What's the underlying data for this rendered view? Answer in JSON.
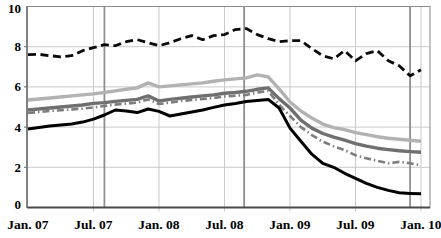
{
  "chart_data": {
    "type": "line",
    "title": "",
    "xlabel": "",
    "ylabel": "",
    "x_axis": {
      "tick_labels": [
        "Jan. 07",
        "Jul. 07",
        "Jan. 08",
        "Jul. 08",
        "Jan. 09",
        "Jul. 09",
        "Jan. 10"
      ],
      "tick_month_index": [
        0,
        6,
        12,
        18,
        24,
        30,
        36
      ],
      "months_total": 36
    },
    "y_axis": {
      "min": 0,
      "max": 10,
      "tick_labels": [
        "0",
        "2",
        "4",
        "6",
        "8",
        "10"
      ],
      "tick_values": [
        0,
        2,
        4,
        6,
        8,
        10
      ]
    },
    "grid": {
      "horizontal": true,
      "vertical": true
    },
    "event_lines_month": [
      7,
      19.8,
      35
    ],
    "series": [
      {
        "name": "light-gray-line",
        "style": "solid",
        "color": "#b2b2b2",
        "width": 3.4,
        "dash": "",
        "values": [
          5.35,
          5.4,
          5.45,
          5.5,
          5.55,
          5.6,
          5.65,
          5.72,
          5.8,
          5.88,
          5.95,
          6.2,
          6.0,
          6.05,
          6.1,
          6.15,
          6.2,
          6.28,
          6.35,
          6.4,
          6.45,
          6.6,
          6.5,
          5.9,
          5.25,
          4.8,
          4.45,
          4.15,
          3.97,
          3.87,
          3.72,
          3.62,
          3.52,
          3.45,
          3.4,
          3.35,
          3.3
        ]
      },
      {
        "name": "medium-gray-line",
        "style": "solid",
        "color": "#6f6f6f",
        "width": 3.4,
        "dash": "",
        "values": [
          4.85,
          4.9,
          4.95,
          5.0,
          5.05,
          5.1,
          5.18,
          5.22,
          5.28,
          5.33,
          5.38,
          5.55,
          5.3,
          5.38,
          5.44,
          5.5,
          5.55,
          5.6,
          5.68,
          5.72,
          5.78,
          5.88,
          5.95,
          5.42,
          4.95,
          4.35,
          3.95,
          3.68,
          3.5,
          3.35,
          3.18,
          3.05,
          2.95,
          2.88,
          2.82,
          2.78,
          2.75
        ]
      },
      {
        "name": "gray-dash-dot-line",
        "style": "dash-dot",
        "color": "#7d7d7d",
        "width": 2.6,
        "dash": "7 3 1.5 3",
        "values": [
          4.7,
          4.75,
          4.8,
          4.84,
          4.88,
          4.92,
          4.98,
          5.05,
          5.12,
          5.17,
          5.22,
          5.38,
          5.15,
          5.22,
          5.3,
          5.35,
          5.4,
          5.45,
          5.52,
          5.56,
          5.6,
          5.72,
          5.8,
          5.12,
          4.55,
          4.0,
          3.6,
          3.28,
          3.05,
          2.85,
          2.6,
          2.45,
          2.32,
          2.2,
          2.27,
          2.2,
          2.1
        ]
      },
      {
        "name": "solid-black-line",
        "style": "solid",
        "color": "#000000",
        "width": 3.0,
        "dash": "",
        "values": [
          3.9,
          3.98,
          4.05,
          4.1,
          4.16,
          4.25,
          4.4,
          4.6,
          4.85,
          4.8,
          4.72,
          4.9,
          4.78,
          4.55,
          4.65,
          4.75,
          4.85,
          4.98,
          5.1,
          5.18,
          5.28,
          5.33,
          5.38,
          4.95,
          3.95,
          3.3,
          2.65,
          2.2,
          2.0,
          1.7,
          1.45,
          1.2,
          1.0,
          0.85,
          0.73,
          0.7,
          0.68
        ]
      },
      {
        "name": "dashed-black-line",
        "style": "dashed",
        "color": "#0a0a0a",
        "width": 2.8,
        "dash": "8 4.5",
        "values": [
          7.6,
          7.62,
          7.55,
          7.5,
          7.55,
          7.8,
          7.95,
          8.1,
          8.05,
          8.25,
          8.35,
          8.2,
          8.05,
          8.2,
          8.4,
          8.55,
          8.35,
          8.55,
          8.6,
          8.85,
          8.9,
          8.6,
          8.4,
          8.25,
          8.3,
          8.3,
          7.9,
          7.55,
          7.4,
          7.8,
          7.3,
          7.65,
          7.8,
          7.3,
          7.05,
          6.55,
          6.85
        ]
      }
    ],
    "colors": {
      "background": "#ffffff",
      "grid": "#c9c9c9",
      "frame": "#8a8a8a",
      "bottom_axis": "#4a4a4a",
      "left_axis": "#6a6a6a",
      "event_line": "#8f8f8f",
      "tick_label": "#000000"
    }
  }
}
